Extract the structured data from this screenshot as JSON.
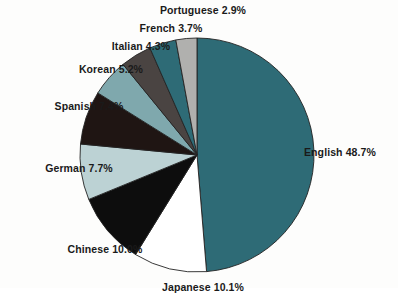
{
  "chart_data": {
    "type": "pie",
    "title": "",
    "categories": [
      "English",
      "Japanese",
      "Chinese",
      "German",
      "Spanish",
      "Korean",
      "Italian",
      "French",
      "Portuguese"
    ],
    "values": [
      48.7,
      10.1,
      10.0,
      7.7,
      7.4,
      5.2,
      4.3,
      3.7,
      2.9
    ],
    "unit": "%",
    "start_angle_deg": 0,
    "direction": "clockwise",
    "legend": "none",
    "labels_position": "outside",
    "slices": [
      {
        "name": "English",
        "value": 48.7,
        "label": "English 48.7%",
        "color": "#2e6b76",
        "label_cut_off": false
      },
      {
        "name": "Japanese",
        "value": 10.1,
        "label": "Japanese 10.1%",
        "color": "#ffffff",
        "label_cut_off": true
      },
      {
        "name": "Chinese",
        "value": 10.0,
        "label": "Chinese 10.0%",
        "color": "#0d0d0d",
        "label_cut_off": false
      },
      {
        "name": "German",
        "value": 7.7,
        "label": "German 7.7%",
        "color": "#bcd2d4",
        "label_cut_off": false
      },
      {
        "name": "Spanish",
        "value": 7.4,
        "label": "Spanish 7.4%",
        "color": "#1f1513",
        "label_cut_off": false
      },
      {
        "name": "Korean",
        "value": 5.2,
        "label": "Korean 5.2%",
        "color": "#7fa8ad",
        "label_cut_off": false
      },
      {
        "name": "Italian",
        "value": 4.3,
        "label": "Italian 4.3%",
        "color": "#4a4442",
        "label_cut_off": false
      },
      {
        "name": "French",
        "value": 3.7,
        "label": "French 3.7%",
        "color": "#2e6b76",
        "label_cut_off": false
      },
      {
        "name": "Portuguese",
        "value": 2.9,
        "label": "Portuguese 2.9%",
        "color": "#b0b0ae",
        "label_cut_off": false
      }
    ]
  },
  "labels": {
    "english": "English 48.7%",
    "japanese": "Japanese 10.1%",
    "chinese": "Chinese 10.0%",
    "german": "German 7.7%",
    "spanish": "Spanish 7.4%",
    "korean": "Korean 5.2%",
    "italian": "Italian 4.3%",
    "french": "French 3.7%",
    "portuguese": "Portuguese 2.9%"
  },
  "geometry": {
    "center_x": 197,
    "center_y": 155,
    "radius": 117
  },
  "colors": {
    "background": "#fdfdfc",
    "outline": "#222222",
    "text": "#1a1a1a"
  }
}
